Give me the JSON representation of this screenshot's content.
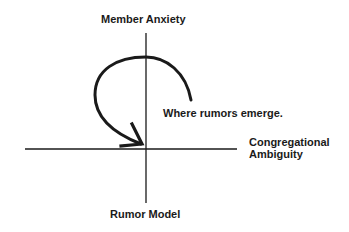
{
  "diagram": {
    "title": "Rumor Model",
    "y_axis_label": "Member Anxiety",
    "x_axis_label_line1": "Congregational",
    "x_axis_label_line2": "Ambiguity",
    "annotation": "Where rumors emerge.",
    "colors": {
      "ink": "#1a1a1a",
      "background": "#ffffff"
    }
  }
}
